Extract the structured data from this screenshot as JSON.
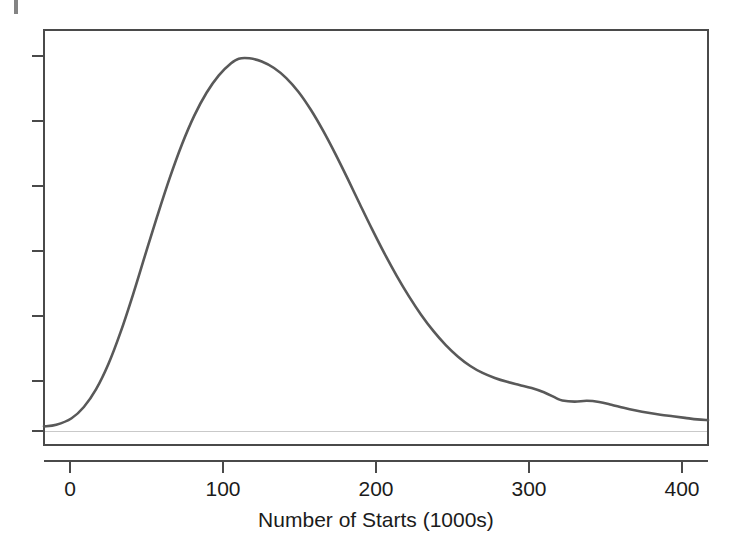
{
  "chart_data": {
    "type": "line",
    "title": "",
    "subtitle": "",
    "xlabel": "Number of Starts (1000s)",
    "ylabel": "",
    "legend": [],
    "grid": false,
    "xlim": [
      -18,
      415
    ],
    "ylim": [
      0,
      1.0
    ],
    "x_ticks": [
      0,
      100,
      200,
      300,
      400
    ],
    "x_tick_labels": [
      "0",
      "100",
      "200",
      "300",
      "400"
    ],
    "y_ticks": [
      0.0,
      0.1667,
      0.3333,
      0.5,
      0.6667,
      0.8333,
      1.0
    ],
    "y_tick_labels": [
      "",
      "",
      "",
      "",
      "",
      "",
      ""
    ],
    "series": [
      {
        "name": "density",
        "color": "#595959",
        "x": [
          -18,
          -10,
          0,
          8,
          16,
          24,
          32,
          40,
          48,
          56,
          64,
          72,
          80,
          88,
          96,
          104,
          109,
          116,
          124,
          132,
          140,
          148,
          156,
          164,
          172,
          180,
          188,
          196,
          204,
          212,
          220,
          228,
          236,
          244,
          252,
          260,
          268,
          276,
          284,
          292,
          300,
          308,
          316,
          320,
          328,
          336,
          344,
          352,
          360,
          368,
          376,
          384,
          392,
          400,
          408,
          415
        ],
        "y": [
          0.012,
          0.016,
          0.033,
          0.062,
          0.108,
          0.173,
          0.256,
          0.352,
          0.455,
          0.557,
          0.654,
          0.741,
          0.815,
          0.874,
          0.919,
          0.95,
          0.962,
          0.963,
          0.955,
          0.938,
          0.912,
          0.876,
          0.83,
          0.776,
          0.716,
          0.652,
          0.586,
          0.521,
          0.459,
          0.401,
          0.348,
          0.3,
          0.258,
          0.222,
          0.192,
          0.168,
          0.15,
          0.137,
          0.127,
          0.119,
          0.111,
          0.1,
          0.085,
          0.079,
          0.076,
          0.078,
          0.075,
          0.068,
          0.06,
          0.053,
          0.047,
          0.042,
          0.038,
          0.034,
          0.03,
          0.028
        ]
      }
    ],
    "annotations": {
      "peak_x": 109,
      "peak_y": 0.962,
      "shoulder_bumps_x": [
        316,
        336
      ]
    },
    "colors": {
      "curve": "#595959",
      "axis": "#4a4a4a",
      "text": "#1b1b1b",
      "zero_line": "#c9c9c9",
      "background": "#ffffff"
    }
  },
  "axis_title": "Number of Starts (1000s)",
  "x_labels": {
    "t0": "0",
    "t1": "100",
    "t2": "200",
    "t3": "300",
    "t4": "400"
  }
}
